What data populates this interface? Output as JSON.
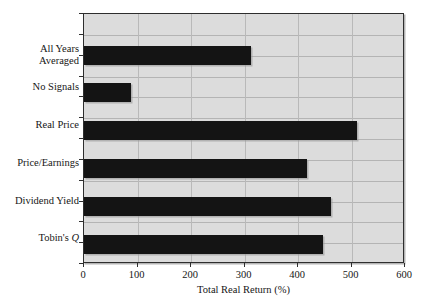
{
  "chart_data": {
    "type": "bar",
    "orientation": "horizontal",
    "title": "",
    "xlabel": "Total Real Return (%)",
    "ylabel": "",
    "xlim": [
      0,
      600
    ],
    "xticks": [
      0,
      100,
      200,
      300,
      400,
      500,
      600
    ],
    "xtick_labels": [
      "0",
      "100",
      "200",
      "300",
      "400",
      "500",
      "600"
    ],
    "grid": true,
    "legend": false,
    "bar_color": "#141414",
    "plot_background": "#dcdcdc",
    "categories": [
      "All Years Averaged",
      "No Signals",
      "Real Price",
      "Price/Earnings",
      "Dividend Yield",
      "Tobin's Q"
    ],
    "category_lines": [
      [
        "All Years",
        "Averaged"
      ],
      [
        "No Signals"
      ],
      [
        "Real Price"
      ],
      [
        "Price/Earnings"
      ],
      [
        "Dividend Yield"
      ],
      [
        "Tobin's Q"
      ]
    ],
    "values": [
      312,
      88,
      510,
      417,
      462,
      447
    ],
    "bars": [
      {
        "label": "All Years Averaged",
        "value": 312
      },
      {
        "label": "No Signals",
        "value": 88
      },
      {
        "label": "Real Price",
        "value": 510
      },
      {
        "label": "Price/Earnings",
        "value": 417
      },
      {
        "label": "Dividend Yield",
        "value": 462
      },
      {
        "label": "Tobin's Q",
        "value": 447
      }
    ]
  },
  "axis": {
    "x_title": "Total Real Return (%)",
    "tick_0": "0",
    "tick_1": "100",
    "tick_2": "200",
    "tick_3": "300",
    "tick_4": "400",
    "tick_5": "500",
    "tick_6": "600"
  },
  "labels": {
    "all_years_line1": "All Years",
    "all_years_line2": "Averaged",
    "no_signals": "No Signals",
    "real_price": "Real Price",
    "price_earnings": "Price/Earnings",
    "dividend_yield": "Dividend Yield",
    "tobins": "Tobin's ",
    "tobins_q": "Q"
  }
}
